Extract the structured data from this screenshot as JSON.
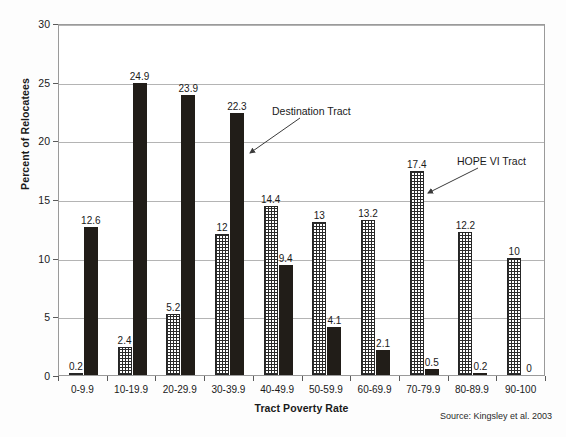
{
  "chart_data": {
    "type": "bar",
    "title": "",
    "xlabel": "Tract Poverty Rate",
    "ylabel": "Percent of Relocatees",
    "ylim": [
      0,
      30
    ],
    "yticks": [
      0,
      5,
      10,
      15,
      20,
      25,
      30
    ],
    "grid": true,
    "legend_position": "annotations",
    "categories": [
      "0-9.9",
      "10-19.9",
      "20-29.9",
      "30-39.9",
      "40-49.9",
      "50-59.9",
      "60-69.9",
      "70-79.9",
      "80-89.9",
      "90-100"
    ],
    "series": [
      {
        "name": "HOPE VI Tract",
        "pattern": "crosshatch",
        "color": "#2b2b2b",
        "values": [
          0.2,
          2.4,
          5.2,
          12,
          14.4,
          13,
          13.2,
          17.4,
          12.2,
          10
        ],
        "value_labels": [
          "0.2",
          "2.4",
          "5.2",
          "12",
          "14.4",
          "13",
          "13.2",
          "17.4",
          "12.2",
          "10"
        ]
      },
      {
        "name": "Destination Tract",
        "pattern": "solid",
        "color": "#211d18",
        "values": [
          12.6,
          24.9,
          23.9,
          22.3,
          9.4,
          4.1,
          2.1,
          0.5,
          0.2,
          0
        ],
        "value_labels": [
          "12.6",
          "24.9",
          "23.9",
          "22.3",
          "9.4",
          "4.1",
          "2.1",
          "0.5",
          "0.2",
          "0"
        ]
      }
    ],
    "annotations": [
      {
        "label": "Destination Tract",
        "target_series": "Destination Tract",
        "target_category": "30-39.9"
      },
      {
        "label": "HOPE VI Tract",
        "target_series": "HOPE VI Tract",
        "target_category": "70-79.9"
      }
    ]
  },
  "axes": {
    "y_tick_labels": [
      "30",
      "25",
      "20",
      "15",
      "10",
      "5",
      "0"
    ],
    "y_title": "Percent of Relocatees",
    "x_title": "Tract Poverty Rate",
    "x_tick_labels": [
      "0-9.9",
      "10-19.9",
      "20-29.9",
      "30-39.9",
      "40-49.9",
      "50-59.9",
      "60-69.9",
      "70-79.9",
      "80-89.9",
      "90-100"
    ]
  },
  "annotations": {
    "destination_tract": "Destination Tract",
    "hope_vi_tract": "HOPE VI Tract"
  },
  "footer": {
    "source": "Source: Kingsley et al. 2003"
  },
  "colors": {
    "bar_dark": "#211d18",
    "bar_hatch": "#2b2b2b",
    "gridline": "#b4b4b4",
    "frame": "#9a9a9a",
    "background": "#fdfdfd"
  }
}
